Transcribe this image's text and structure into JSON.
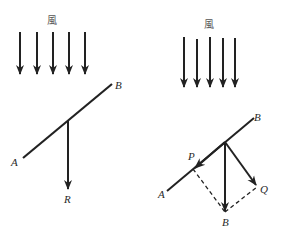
{
  "left_figure": {
    "wind_label": "風",
    "wind_arrow_count": 5,
    "labels": {
      "a": "A",
      "b": "B",
      "resultant": "R"
    }
  },
  "right_figure": {
    "wind_label": "風",
    "wind_arrow_count": 5,
    "labels": {
      "a": "A",
      "b": "B",
      "p": "P",
      "q": "Q",
      "resultant": "B"
    }
  },
  "colors": {
    "stroke": "#222222",
    "background": "#ffffff"
  }
}
